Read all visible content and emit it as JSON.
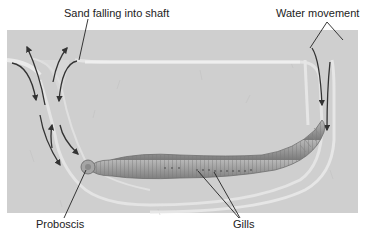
{
  "diagram": {
    "labels": {
      "sand_falling": "Sand falling into shaft",
      "water_movement": "Water movement",
      "proboscis": "Proboscis",
      "gills": "Gills"
    },
    "colors": {
      "sand": "#cfcfcf",
      "burrow_wall": "#e6e6e6",
      "burrow_interior": "#dadada",
      "worm_body": "#9a9a9a",
      "worm_dark": "#6e6e6e",
      "arrow": "#333333",
      "leader_line": "#222222"
    }
  }
}
